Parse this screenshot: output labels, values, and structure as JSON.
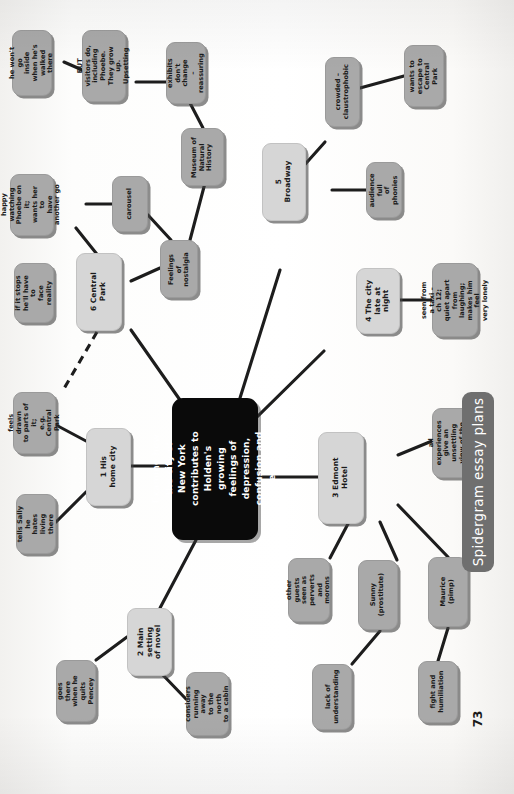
{
  "page": {
    "banner_label": "Spidergram essay plans",
    "page_number": "73",
    "accent_center_bg": "#0a0a0a",
    "accent_major_bg": "#d6d6d6",
    "accent_sub_bg": "#a9a9a9",
    "banner_bg": "#6f6f6f"
  },
  "center": {
    "text": "Examine how the city of\nNew York contributes to\nHolden's growing\nfeelings of depression,\nconfusion and loneliness."
  },
  "nodes": [
    {
      "id": "n1",
      "label": "1 His home city",
      "level": "major"
    },
    {
      "id": "n2",
      "label": "2 Main setting\nof novel",
      "level": "major"
    },
    {
      "id": "n3",
      "label": "3 Edmont Hotel",
      "level": "major"
    },
    {
      "id": "n4",
      "label": "4 The city\nlate at night",
      "level": "major"
    },
    {
      "id": "n5",
      "label": "5 Broadway",
      "level": "major"
    },
    {
      "id": "n6",
      "label": "6 Central Park",
      "level": "major"
    },
    {
      "id": "s1a",
      "label": "feels drawn\nto parts of it;\ne.g. Central\nPark",
      "level": "sub"
    },
    {
      "id": "s1b",
      "label": "tells Sally he\nhates living\nthere",
      "level": "sub"
    },
    {
      "id": "s2a",
      "label": "goes there\nwhen he\nquits Pencey",
      "level": "sub"
    },
    {
      "id": "s2b",
      "label": "considers\nrunning away\nto the north\nto a cabin",
      "level": "sub"
    },
    {
      "id": "s3a",
      "label": "all experiences\ngive an unsettling\nview of the adult\nworld",
      "level": "sub"
    },
    {
      "id": "s3b",
      "label": "other guests\nseen as\nperverts and\nmorons",
      "level": "sub"
    },
    {
      "id": "s3c",
      "label": "Sunny\n(prostitute)",
      "level": "sub"
    },
    {
      "id": "s3d",
      "label": "Maurice\n(pimp)",
      "level": "sub"
    },
    {
      "id": "s3e",
      "label": "lack of\nunderstanding",
      "level": "sub"
    },
    {
      "id": "s3f",
      "label": "fight and\nhumiliation",
      "level": "sub"
    },
    {
      "id": "s4a",
      "label": "seen from a taxi –\nch 12; quiet apart\nfrom laughing;\nmakes him feel\nvery lonely",
      "level": "sub"
    },
    {
      "id": "s5a",
      "label": "crowded –\nclaustrophobic",
      "level": "sub"
    },
    {
      "id": "s5b",
      "label": "wants to\nescape to\nCentral Park",
      "level": "sub"
    },
    {
      "id": "s5c",
      "label": "audience full\nof phonies",
      "level": "sub"
    },
    {
      "id": "s6a",
      "label": "Feelings of\nnostalgia",
      "level": "sub"
    },
    {
      "id": "s6b",
      "label": "carousel",
      "level": "sub"
    },
    {
      "id": "s6c",
      "label": "happy watching\nPhoebe on it;\nwants her to\nhave another go",
      "level": "sub"
    },
    {
      "id": "s6d",
      "label": "if it stops\nhe'll have to\nface reality",
      "level": "sub"
    },
    {
      "id": "s6e",
      "label": "Museum of\nNatural\nHistory",
      "level": "sub"
    },
    {
      "id": "s6f",
      "label": "exhibits\ndon't change\n– reassuring",
      "level": "sub"
    },
    {
      "id": "s6g",
      "label": "BUT visitors do,\nincluding Phoebe.\nThey grow up.\nUpsetting",
      "level": "sub"
    },
    {
      "id": "s6h",
      "label": "he won't go\ninside when he's\nwalked there",
      "level": "sub"
    }
  ]
}
